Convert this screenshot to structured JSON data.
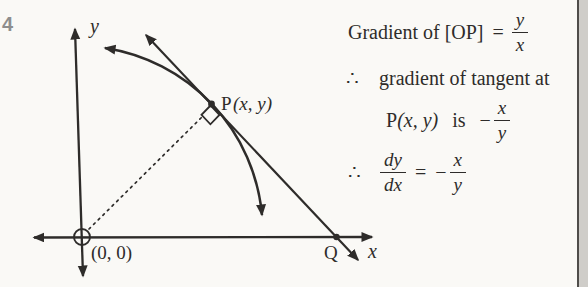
{
  "problem_number": "4",
  "colors": {
    "ink": "#2e2c2a",
    "paper": "#faf9f6",
    "number_grey": "#8e8e8e",
    "edge_strip": "#cfcdc9"
  },
  "diagram": {
    "labels": {
      "y_axis": "y",
      "x_axis": "x",
      "origin": "(0, 0)",
      "p_name": "P",
      "p_args": "(x, y)",
      "point_q": "Q"
    }
  },
  "derivation": {
    "line1": {
      "text": "Gradient of [OP]",
      "eq": "=",
      "num": "y",
      "den": "x"
    },
    "line2": {
      "tf": "∴",
      "text": "gradient of tangent at"
    },
    "line3": {
      "p": "P",
      "args": "(x, y)",
      "is": "is",
      "minus": "−",
      "num": "x",
      "den": "y"
    },
    "line4": {
      "tf": "∴",
      "lnum": "dy",
      "lden": "dx",
      "eq": "=",
      "minus": "−",
      "num": "x",
      "den": "y"
    }
  }
}
